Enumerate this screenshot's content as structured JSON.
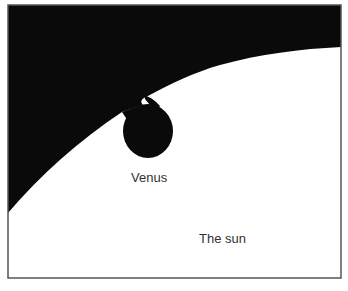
{
  "diagram": {
    "labels": {
      "venus": "Venus",
      "sun": "The sun"
    },
    "colors": {
      "sky": "#0a0a0a",
      "sun": "#ffffff",
      "venus": "#0a0a0a",
      "frame": "#555555",
      "text": "#333333"
    }
  }
}
